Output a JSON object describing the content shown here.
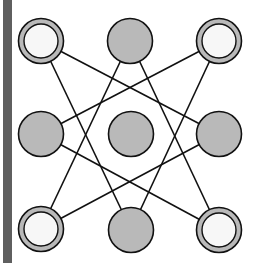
{
  "diagram": {
    "colors": {
      "background": "#ffffff",
      "edge_strip": "#5f5f5f",
      "filled_node": "#b9b9b9",
      "ring_node_outer": "#b9b9b9",
      "ring_node_inner": "#f7f7f7",
      "stroke": "#111111"
    },
    "nodes": [
      {
        "id": "top-left",
        "x": 41,
        "y": 41,
        "type": "ring"
      },
      {
        "id": "top-middle",
        "x": 130,
        "y": 41,
        "type": "filled"
      },
      {
        "id": "top-right",
        "x": 219,
        "y": 41,
        "type": "ring"
      },
      {
        "id": "middle-left",
        "x": 41,
        "y": 134,
        "type": "filled"
      },
      {
        "id": "center",
        "x": 131,
        "y": 134,
        "type": "filled"
      },
      {
        "id": "middle-right",
        "x": 219,
        "y": 134,
        "type": "filled"
      },
      {
        "id": "bottom-left",
        "x": 41,
        "y": 229,
        "type": "ring"
      },
      {
        "id": "bottom-middle",
        "x": 131,
        "y": 230,
        "type": "filled"
      },
      {
        "id": "bottom-right",
        "x": 219,
        "y": 230,
        "type": "ring"
      }
    ],
    "edges": [
      [
        "top-left",
        "bottom-middle"
      ],
      [
        "top-left",
        "middle-right"
      ],
      [
        "top-middle",
        "bottom-left"
      ],
      [
        "top-middle",
        "bottom-right"
      ],
      [
        "top-right",
        "middle-left"
      ],
      [
        "top-right",
        "bottom-middle"
      ],
      [
        "middle-left",
        "bottom-right"
      ],
      [
        "middle-right",
        "bottom-left"
      ]
    ]
  }
}
